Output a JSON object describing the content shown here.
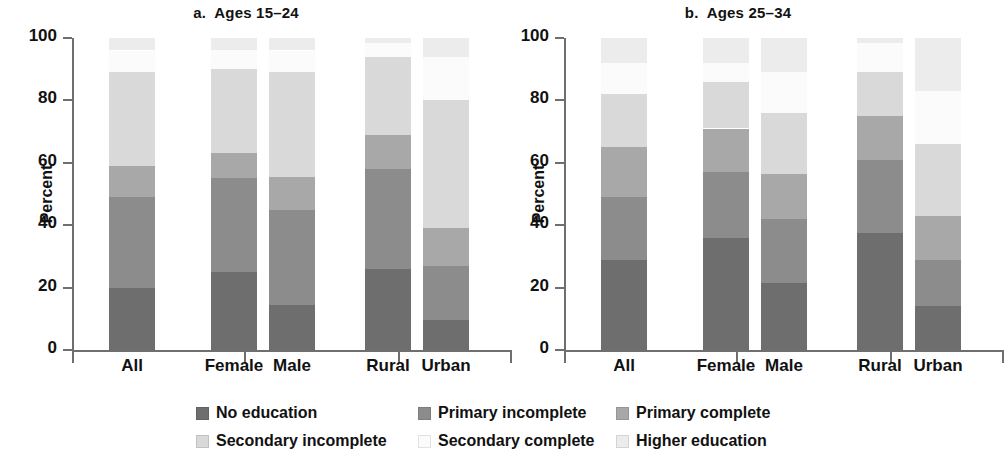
{
  "figure": {
    "y_axis_title": "Percent"
  },
  "legend": {
    "items": [
      {
        "label": "No education",
        "color": "#6e6e6e"
      },
      {
        "label": "Primary incomplete",
        "color": "#8c8c8c"
      },
      {
        "label": "Primary complete",
        "color": "#a8a8a8"
      },
      {
        "label": "Secondary incomplete",
        "color": "#d9d9d9"
      },
      {
        "label": "Secondary complete",
        "color": "#fbfbfb"
      },
      {
        "label": "Higher education",
        "color": "#ececec"
      }
    ]
  },
  "chart_data": [
    {
      "type": "bar",
      "stacked": true,
      "panel": "a",
      "title": "a.  Ages 15–24",
      "xlabel": "",
      "ylabel": "Percent",
      "ylim": [
        0,
        100
      ],
      "yticks": [
        0,
        20,
        40,
        60,
        80,
        100
      ],
      "grid": false,
      "legend_position": "bottom",
      "categories": [
        "All",
        "Female",
        "Male",
        "Rural",
        "Urban"
      ],
      "series": [
        {
          "name": "No education",
          "color": "#6e6e6e",
          "values": [
            20,
            25,
            14.5,
            26,
            9.5
          ]
        },
        {
          "name": "Primary incomplete",
          "color": "#8c8c8c",
          "values": [
            29,
            30,
            30.5,
            32,
            17.5
          ]
        },
        {
          "name": "Primary complete",
          "color": "#a8a8a8",
          "values": [
            10,
            8,
            10.5,
            11,
            12
          ]
        },
        {
          "name": "Secondary incomplete",
          "color": "#d9d9d9",
          "values": [
            30,
            27,
            33.5,
            25,
            41
          ]
        },
        {
          "name": "Secondary complete",
          "color": "#fbfbfb",
          "values": [
            7,
            6,
            7,
            4.5,
            14
          ]
        },
        {
          "name": "Higher education",
          "color": "#ececec",
          "values": [
            4,
            4,
            4,
            1.5,
            6
          ]
        }
      ]
    },
    {
      "type": "bar",
      "stacked": true,
      "panel": "b",
      "title": "b.  Ages 25–34",
      "xlabel": "",
      "ylabel": "Percent",
      "ylim": [
        0,
        100
      ],
      "yticks": [
        0,
        20,
        40,
        60,
        80,
        100
      ],
      "grid": false,
      "legend_position": "bottom",
      "categories": [
        "All",
        "Female",
        "Male",
        "Rural",
        "Urban"
      ],
      "series": [
        {
          "name": "No education",
          "color": "#6e6e6e",
          "values": [
            29,
            36,
            21.5,
            37.5,
            14
          ]
        },
        {
          "name": "Primary incomplete",
          "color": "#8c8c8c",
          "values": [
            20,
            21,
            20.5,
            23.5,
            15
          ]
        },
        {
          "name": "Primary complete",
          "color": "#a8a8a8",
          "values": [
            16,
            14,
            14.5,
            14,
            14
          ]
        },
        {
          "name": "Secondary incomplete",
          "color": "#d9d9d9",
          "values": [
            17,
            15,
            19.5,
            14,
            23
          ]
        },
        {
          "name": "Secondary complete",
          "color": "#fbfbfb",
          "values": [
            10,
            6,
            13,
            9.5,
            17
          ]
        },
        {
          "name": "Higher education",
          "color": "#ececec",
          "values": [
            8,
            8,
            11,
            1.5,
            17
          ]
        }
      ]
    }
  ]
}
